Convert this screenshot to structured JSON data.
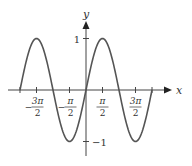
{
  "chart_data": {
    "type": "line",
    "title": "",
    "function": "y = sin(x)",
    "xlabel": "x",
    "ylabel": "y",
    "xlim": [
      -6.2832,
      6.2832
    ],
    "ylim": [
      -1,
      1
    ],
    "grid": false,
    "legend": null,
    "x_ticks": [
      {
        "value": -4.712,
        "label_num": "3π",
        "label_den": "2",
        "sign": "−"
      },
      {
        "value": -1.5708,
        "label_num": "π",
        "label_den": "2",
        "sign": "−"
      },
      {
        "value": 1.5708,
        "label_num": "π",
        "label_den": "2",
        "sign": ""
      },
      {
        "value": 4.712,
        "label_num": "3π",
        "label_den": "2",
        "sign": ""
      }
    ],
    "y_ticks": [
      {
        "value": 1,
        "label": "1"
      },
      {
        "value": -1,
        "label": "−1"
      }
    ],
    "series": [
      {
        "name": "sin(x)",
        "color": "#555555",
        "x": [
          -6.2832,
          -4.7124,
          -3.1416,
          -1.5708,
          0,
          1.5708,
          3.1416,
          4.7124,
          6.2832
        ],
        "y": [
          0,
          1,
          0,
          -1,
          0,
          1,
          0,
          -1,
          0
        ]
      }
    ]
  }
}
